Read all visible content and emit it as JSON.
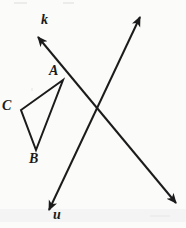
{
  "figure": {
    "background_color": "#fbfbfa",
    "ink_color": "#1b1b1b",
    "stroke_width": 2,
    "labels": {
      "line_k": "k",
      "line_u": "u",
      "vertex_a": "A",
      "vertex_b": "B",
      "vertex_c": "C"
    },
    "lines": [
      {
        "name": "k",
        "label": "k",
        "arrowheads": "both",
        "from": [
          36,
          35
        ],
        "to": [
          178,
          205
        ]
      },
      {
        "name": "u",
        "label": "u",
        "arrowheads": "both",
        "from": [
          142,
          15
        ],
        "to": [
          47,
          213
        ]
      }
    ],
    "intersection": [
      100,
      107
    ],
    "triangle": {
      "name": "ABC",
      "vertices": [
        {
          "label": "A",
          "x": 63,
          "y": 80
        },
        {
          "label": "C",
          "x": 21,
          "y": 110
        },
        {
          "label": "B",
          "x": 36,
          "y": 150
        }
      ]
    }
  }
}
